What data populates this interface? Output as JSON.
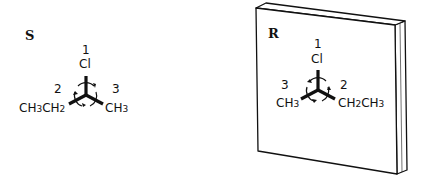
{
  "left_molecule": {
    "configuration": "S",
    "top": {
      "priority": "1",
      "group": "Cl"
    },
    "left": {
      "priority": "2",
      "group_main": "CH",
      "sub1": "3",
      "group_mid": "CH",
      "sub2": "2"
    },
    "right": {
      "priority": "3",
      "group_main": "CH",
      "sub1": "3"
    },
    "rotation": "counterclockwise"
  },
  "right_molecule": {
    "configuration": "R",
    "top": {
      "priority": "1",
      "group": "Cl"
    },
    "left": {
      "priority": "3",
      "group_main": "CH",
      "sub1": "3"
    },
    "right": {
      "priority": "2",
      "group_main": "CH",
      "sub1": "2",
      "group_mid": "CH",
      "sub2": "3"
    },
    "rotation": "clockwise"
  },
  "mirror": {
    "label": "mirror-plane"
  },
  "colors": {
    "ink": "#111111",
    "background": "#ffffff"
  }
}
